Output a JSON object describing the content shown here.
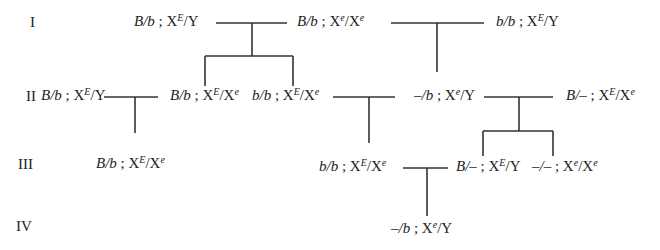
{
  "diagram": {
    "type": "pedigree",
    "generations": [
      "I",
      "II",
      "III",
      "IV"
    ],
    "individuals": [
      {
        "id": "I-1",
        "gen": "I",
        "autosomal": "B/b",
        "sex_linked": [
          "E",
          "Y"
        ]
      },
      {
        "id": "I-2",
        "gen": "I",
        "autosomal": "B/b",
        "sex_linked": [
          "e",
          "e"
        ]
      },
      {
        "id": "I-3",
        "gen": "I",
        "autosomal": "b/b",
        "sex_linked": [
          "E",
          "Y"
        ]
      },
      {
        "id": "II-1",
        "gen": "II",
        "autosomal": "B/b",
        "sex_linked": [
          "E",
          "Y"
        ]
      },
      {
        "id": "II-2",
        "gen": "II",
        "autosomal": "B/b",
        "sex_linked": [
          "E",
          "e"
        ]
      },
      {
        "id": "II-3",
        "gen": "II",
        "autosomal": "b/b",
        "sex_linked": [
          "E",
          "e"
        ]
      },
      {
        "id": "II-4",
        "gen": "II",
        "autosomal": "–/b",
        "sex_linked": [
          "e",
          "Y"
        ]
      },
      {
        "id": "II-5",
        "gen": "II",
        "autosomal": "B/–",
        "sex_linked": [
          "E",
          "e"
        ]
      },
      {
        "id": "III-1",
        "gen": "III",
        "autosomal": "B/b",
        "sex_linked": [
          "E",
          "e"
        ]
      },
      {
        "id": "III-2",
        "gen": "III",
        "autosomal": "b/b",
        "sex_linked": [
          "E",
          "e"
        ]
      },
      {
        "id": "III-3",
        "gen": "III",
        "autosomal": "B/–",
        "sex_linked": [
          "E",
          "Y"
        ]
      },
      {
        "id": "III-4",
        "gen": "III",
        "autosomal": "–/–",
        "sex_linked": [
          "e",
          "e"
        ]
      },
      {
        "id": "IV-1",
        "gen": "IV",
        "autosomal": "–/b",
        "sex_linked": [
          "e",
          "Y"
        ]
      }
    ],
    "labels": {
      "I-1": {
        "a": "B/b",
        "sep": " ; X",
        "s1": "E",
        "mid": "/",
        "x2": "Y",
        "s2": ""
      },
      "I-2": {
        "a": "B/b",
        "sep": " ; X",
        "s1": "e",
        "mid": "/X",
        "x2": "",
        "s2": "e"
      },
      "I-3": {
        "a": "b/b",
        "sep": " ; X",
        "s1": "E",
        "mid": "/",
        "x2": "Y",
        "s2": ""
      },
      "II-1": {
        "a": "B/b",
        "sep": " ; X",
        "s1": "E",
        "mid": "/",
        "x2": "Y",
        "s2": ""
      },
      "II-2": {
        "a": "B/b",
        "sep": " ; X",
        "s1": "E",
        "mid": "/X",
        "x2": "",
        "s2": "e"
      },
      "II-3": {
        "a": "b/b",
        "sep": " ; X",
        "s1": "E",
        "mid": "/X",
        "x2": "",
        "s2": "e"
      },
      "II-4": {
        "a": "–/b",
        "sep": " ; X",
        "s1": "e",
        "mid": "/",
        "x2": "Y",
        "s2": ""
      },
      "II-5": {
        "a": "B/–",
        "sep": " ; X",
        "s1": "E",
        "mid": "/X",
        "x2": "",
        "s2": "e"
      },
      "III-1": {
        "a": "B/b",
        "sep": " ; X",
        "s1": "E",
        "mid": "/X",
        "x2": "",
        "s2": "e"
      },
      "III-2": {
        "a": "b/b",
        "sep": " ; X",
        "s1": "E",
        "mid": "/X",
        "x2": "",
        "s2": "e"
      },
      "III-3": {
        "a": "B/–",
        "sep": " ; X",
        "s1": "E",
        "mid": "/",
        "x2": "Y",
        "s2": ""
      },
      "III-4": {
        "a": "–/–",
        "sep": " ; X",
        "s1": "e",
        "mid": "/X",
        "x2": "",
        "s2": "e"
      },
      "IV-1": {
        "a": "–/b",
        "sep": " ; X",
        "s1": "e",
        "mid": "/",
        "x2": "Y",
        "s2": ""
      }
    },
    "matings": [
      {
        "parents": [
          "I-1",
          "I-2"
        ],
        "children": [
          "II-2",
          "II-3"
        ]
      },
      {
        "parents": [
          "I-2",
          "I-3"
        ],
        "children": [
          "II-4"
        ]
      },
      {
        "parents": [
          "II-1",
          "II-2"
        ],
        "children": [
          "III-1"
        ]
      },
      {
        "parents": [
          "II-3",
          "II-4"
        ],
        "children": [
          "III-2"
        ]
      },
      {
        "parents": [
          "II-4",
          "II-5"
        ],
        "children": [
          "III-3",
          "III-4"
        ]
      },
      {
        "parents": [
          "III-2",
          "III-3"
        ],
        "children": [
          "IV-1"
        ]
      }
    ]
  }
}
